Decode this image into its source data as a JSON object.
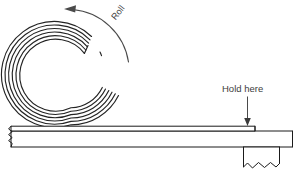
{
  "figure": {
    "background_color": "#ffffff",
    "ink_color": "#1a1a1a",
    "label_color": "#3d3d3d",
    "arrow_color": "#4a4a4a",
    "width": 302,
    "height": 178
  },
  "labels": {
    "roll": "Roll",
    "hold_here": "Hold here"
  },
  "annotations": {
    "roll_arrow": {
      "name": "curved-rotation-arrow",
      "direction": "counter-clockwise",
      "head_position": "left"
    },
    "hold_arrow": {
      "name": "downward-pointer-arrow",
      "direction": "down",
      "target": "strip-top-surface"
    }
  },
  "coil": {
    "name": "spiral-roll",
    "center_x": 71,
    "center_y": 71,
    "outer_radius": 54,
    "inner_radius": 38,
    "turns": 6
  },
  "strip": {
    "name": "flat-strip",
    "left_edge_x": 9,
    "right_edge_x": 293,
    "top_y": 126,
    "bottom_y": 147,
    "torn_left_edge": true,
    "stepped_right_end": true
  },
  "tab": {
    "name": "torn-hanging-tab",
    "left_x": 243,
    "right_x": 280,
    "top_y": 147,
    "bottom_y": 172,
    "jagged_bottom": true
  }
}
